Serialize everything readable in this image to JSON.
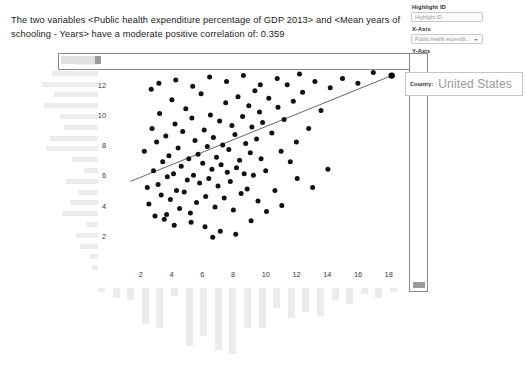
{
  "window": {
    "ghost_top_text": "",
    "ghost_top_right": ""
  },
  "correlation": {
    "text": "The two variables <Public health expenditure percentage of GDP 2013> and <Mean years of schooling - Years> have a moderate positive correlation of: 0.359",
    "value": 0.359,
    "strength": "moderate positive",
    "variable_x": "Public health expenditure percentage of GDP 2013",
    "variable_y": "Mean years of schooling - Years"
  },
  "controls": {
    "highlight": {
      "label": "Highlight ID",
      "placeholder": "Highlight ID",
      "value": "",
      "icon": "search-icon"
    },
    "x_axis": {
      "label": "X-Axis",
      "value": "Public health expendit...",
      "icon": "chevron-down-icon"
    },
    "y_axis": {
      "label": "Y-Axis",
      "value": "",
      "icon": "chevron-down-icon"
    }
  },
  "tooltip": {
    "key": "Country:",
    "value": "United States"
  },
  "chart_data": {
    "type": "scatter",
    "title": "",
    "xlabel": "Public health expenditure percentage of GDP 2013",
    "ylabel": "Mean years of schooling - Years",
    "xlim": [
      0,
      19
    ],
    "ylim": [
      0,
      13.5
    ],
    "xticks": [
      2,
      4,
      6,
      8,
      10,
      12,
      14,
      16,
      18
    ],
    "yticks": [
      2,
      4,
      6,
      8,
      10,
      12
    ],
    "grid": false,
    "legend": null,
    "trendline": {
      "x0": 1.2,
      "y0": 5.6,
      "x1": 18.2,
      "y1": 12.6,
      "correlation": 0.359
    },
    "highlighted_point": {
      "label": "United States",
      "x": 18.2,
      "y": 12.6
    },
    "points": [
      [
        2.1,
        7.6
      ],
      [
        2.3,
        5.2
      ],
      [
        2.4,
        4.1
      ],
      [
        2.6,
        9.1
      ],
      [
        2.7,
        6.3
      ],
      [
        2.8,
        3.3
      ],
      [
        2.9,
        8.2
      ],
      [
        3.0,
        5.4
      ],
      [
        3.1,
        10.1
      ],
      [
        3.2,
        4.7
      ],
      [
        3.3,
        6.9
      ],
      [
        3.4,
        3.1
      ],
      [
        3.5,
        8.6
      ],
      [
        3.6,
        5.9
      ],
      [
        3.7,
        7.3
      ],
      [
        3.8,
        4.4
      ],
      [
        3.9,
        11.0
      ],
      [
        4.0,
        6.1
      ],
      [
        4.1,
        9.4
      ],
      [
        4.2,
        5.0
      ],
      [
        4.3,
        7.8
      ],
      [
        4.4,
        3.8
      ],
      [
        4.5,
        6.6
      ],
      [
        4.6,
        8.9
      ],
      [
        4.7,
        4.9
      ],
      [
        4.8,
        10.4
      ],
      [
        4.9,
        5.7
      ],
      [
        5.0,
        7.1
      ],
      [
        5.1,
        3.5
      ],
      [
        5.2,
        9.8
      ],
      [
        5.3,
        6.0
      ],
      [
        5.4,
        8.3
      ],
      [
        5.5,
        4.2
      ],
      [
        5.6,
        7.4
      ],
      [
        5.7,
        5.5
      ],
      [
        5.8,
        11.4
      ],
      [
        5.9,
        6.8
      ],
      [
        6.0,
        9.0
      ],
      [
        6.1,
        4.6
      ],
      [
        6.2,
        7.9
      ],
      [
        6.3,
        5.8
      ],
      [
        6.4,
        10.0
      ],
      [
        6.5,
        6.4
      ],
      [
        6.6,
        8.5
      ],
      [
        6.7,
        3.9
      ],
      [
        6.8,
        7.2
      ],
      [
        6.9,
        5.3
      ],
      [
        7.0,
        9.6
      ],
      [
        7.1,
        6.7
      ],
      [
        7.2,
        8.0
      ],
      [
        7.3,
        4.5
      ],
      [
        7.4,
        10.8
      ],
      [
        7.5,
        6.2
      ],
      [
        7.6,
        7.7
      ],
      [
        7.7,
        5.6
      ],
      [
        7.8,
        9.3
      ],
      [
        7.9,
        3.7
      ],
      [
        8.0,
        8.7
      ],
      [
        8.1,
        6.5
      ],
      [
        8.2,
        11.2
      ],
      [
        8.3,
        7.0
      ],
      [
        8.4,
        4.8
      ],
      [
        8.5,
        9.9
      ],
      [
        8.6,
        6.1
      ],
      [
        8.7,
        8.1
      ],
      [
        8.8,
        5.1
      ],
      [
        8.9,
        10.6
      ],
      [
        9.0,
        7.5
      ],
      [
        9.1,
        9.2
      ],
      [
        9.2,
        6.0
      ],
      [
        9.3,
        11.6
      ],
      [
        9.4,
        8.4
      ],
      [
        9.5,
        4.3
      ],
      [
        9.6,
        10.2
      ],
      [
        9.7,
        7.1
      ],
      [
        9.8,
        9.5
      ],
      [
        10.0,
        6.3
      ],
      [
        10.2,
        11.1
      ],
      [
        10.4,
        8.8
      ],
      [
        10.6,
        5.0
      ],
      [
        10.8,
        10.5
      ],
      [
        11.0,
        7.6
      ],
      [
        11.2,
        9.7
      ],
      [
        11.4,
        12.0
      ],
      [
        11.6,
        6.9
      ],
      [
        11.8,
        10.9
      ],
      [
        12.0,
        8.2
      ],
      [
        12.4,
        11.5
      ],
      [
        12.8,
        9.1
      ],
      [
        13.2,
        12.2
      ],
      [
        13.6,
        10.3
      ],
      [
        14.2,
        11.8
      ],
      [
        15.0,
        12.4
      ],
      [
        16.0,
        12.1
      ],
      [
        17.0,
        12.8
      ],
      [
        18.2,
        12.6
      ],
      [
        3.05,
        12.1
      ],
      [
        4.15,
        12.3
      ],
      [
        5.25,
        11.9
      ],
      [
        6.35,
        12.5
      ],
      [
        7.45,
        12.2
      ],
      [
        8.55,
        12.6
      ],
      [
        9.65,
        12.0
      ],
      [
        10.75,
        12.4
      ],
      [
        2.55,
        11.7
      ],
      [
        12.2,
        12.7
      ],
      [
        6.05,
        2.6
      ],
      [
        7.05,
        2.3
      ],
      [
        5.15,
        2.9
      ],
      [
        8.05,
        2.1
      ],
      [
        4.05,
        2.7
      ],
      [
        9.05,
        3.0
      ],
      [
        6.55,
        1.9
      ],
      [
        3.55,
        3.4
      ],
      [
        10.05,
        3.6
      ],
      [
        11.05,
        4.0
      ],
      [
        13.05,
        5.2
      ],
      [
        14.05,
        6.4
      ],
      [
        12.05,
        5.8
      ]
    ]
  },
  "marginal_left": {
    "orientation": "horizontal",
    "bar_widths": [
      22,
      46,
      56,
      44,
      54,
      38,
      34,
      48,
      52,
      26,
      14,
      32,
      20,
      28,
      36,
      12,
      22,
      18,
      8,
      6
    ]
  },
  "marginal_bottom": {
    "orientation": "vertical",
    "bar_heights": [
      4,
      10,
      12,
      36,
      40,
      8,
      58,
      48,
      62,
      66,
      40,
      40,
      20,
      30,
      24,
      28,
      12,
      16,
      6,
      10,
      4
    ]
  },
  "selection": {
    "top_strip_name": "top-marginal-selection",
    "right_strip_name": "right-marginal-selection"
  }
}
